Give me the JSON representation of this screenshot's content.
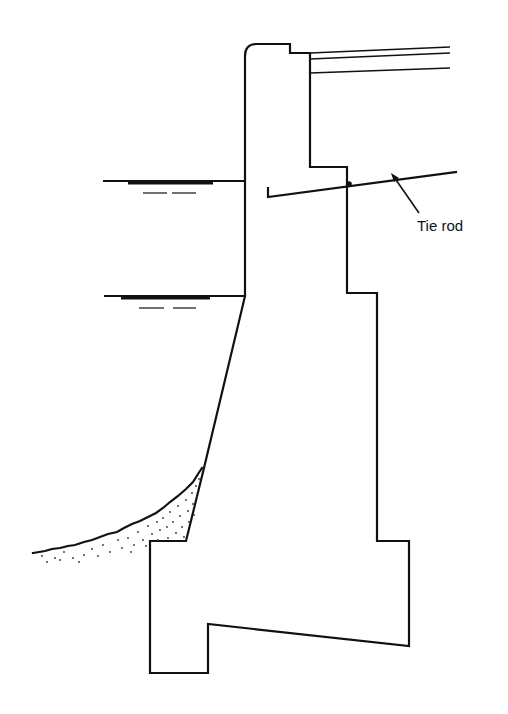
{
  "diagram": {
    "type": "engineering cross-section",
    "labels": {
      "tie_rod": "Tie rod"
    },
    "elements": [
      "wall-body",
      "deck-slab-lines",
      "upper-water-level",
      "lower-water-level",
      "tie-rod",
      "seabed-soil-fill"
    ],
    "colors": {
      "stroke": "#111111",
      "background": "#ffffff"
    }
  }
}
